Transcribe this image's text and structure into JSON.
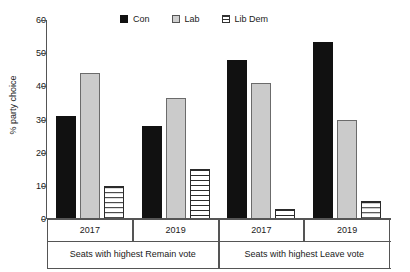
{
  "chart_data": {
    "type": "bar",
    "title": "",
    "subtitle": "",
    "xlabel": "",
    "ylabel": "% party choice",
    "ylim": [
      0,
      60
    ],
    "yticks": [
      0,
      10,
      20,
      30,
      40,
      50,
      60
    ],
    "ytick_labels": [
      "0",
      "10",
      "20",
      "30",
      "40",
      "50",
      "60"
    ],
    "grid": false,
    "legend_position": "top-center",
    "categories": [
      "2017",
      "2019",
      "2017",
      "2019"
    ],
    "group_labels": [
      "Seats with highest Remain vote",
      "Seats with highest Leave vote"
    ],
    "group_spans": [
      2,
      2
    ],
    "series": [
      {
        "name": "Con",
        "color": "#111111",
        "fill": "solid",
        "values": [
          31,
          28,
          48,
          53.5
        ]
      },
      {
        "name": "Lab",
        "color": "#cbcbcb",
        "fill": "light-gray",
        "values": [
          44,
          36.5,
          41,
          30
        ]
      },
      {
        "name": "Lib Dem",
        "color": "#ffffff",
        "fill": "horizontal-hatch",
        "values": [
          10,
          15,
          3,
          5.5
        ]
      }
    ]
  },
  "legend": {
    "entries": [
      {
        "label": "Con",
        "swatch": "filled-square-black-icon"
      },
      {
        "label": "Lab",
        "swatch": "filled-square-gray-icon"
      },
      {
        "label": "Lib Dem",
        "swatch": "hatched-square-icon"
      }
    ]
  },
  "axes": {
    "y_label": "% party choice",
    "y_ticks": [
      "60",
      "50",
      "40",
      "30",
      "20",
      "10",
      "0"
    ],
    "x_tier1": [
      "2017",
      "2019",
      "2017",
      "2019"
    ],
    "x_tier2": [
      "Seats with highest Remain vote",
      "Seats with highest Leave vote"
    ]
  }
}
